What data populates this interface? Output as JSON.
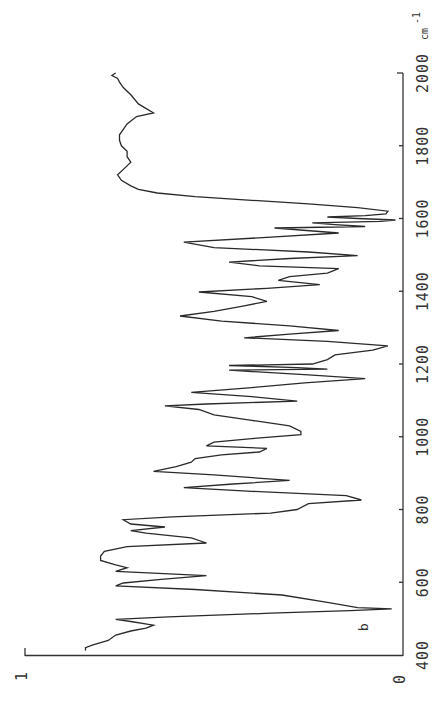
{
  "chart_data": {
    "type": "line",
    "title": "",
    "orientation": "rotated 90° (wavenumber axis vertical on right, increasing upward; transmittance axis horizontal along bottom, decreasing to the right)",
    "xlabel": "cm-1",
    "ylabel": "",
    "xlim": [
      400,
      2000
    ],
    "ylim": [
      0,
      1
    ],
    "x_ticks": [
      400,
      600,
      800,
      1000,
      1200,
      1400,
      1600,
      1800,
      2000
    ],
    "x_tick_labels": [
      "400",
      "600",
      "800",
      "1000",
      "1200",
      "1400",
      "1600",
      "1800",
      "2000"
    ],
    "x_unit": "cm",
    "x_unit_exp": "-1",
    "y_ticks": [
      0,
      1
    ],
    "y_tick_labels": [
      "0",
      "1"
    ],
    "panel_label": "b",
    "grid": false,
    "legend": null,
    "series": [
      {
        "name": "spectrum b",
        "points": [
          [
            2000,
            0.76
          ],
          [
            1993,
            0.77
          ],
          [
            1985,
            0.755
          ],
          [
            1975,
            0.75
          ],
          [
            1960,
            0.74
          ],
          [
            1940,
            0.72
          ],
          [
            1915,
            0.7
          ],
          [
            1890,
            0.66
          ],
          [
            1880,
            0.705
          ],
          [
            1860,
            0.73
          ],
          [
            1845,
            0.74
          ],
          [
            1830,
            0.75
          ],
          [
            1815,
            0.75
          ],
          [
            1800,
            0.745
          ],
          [
            1785,
            0.73
          ],
          [
            1770,
            0.73
          ],
          [
            1755,
            0.72
          ],
          [
            1740,
            0.735
          ],
          [
            1720,
            0.755
          ],
          [
            1705,
            0.745
          ],
          [
            1690,
            0.72
          ],
          [
            1680,
            0.7
          ],
          [
            1670,
            0.65
          ],
          [
            1660,
            0.55
          ],
          [
            1650,
            0.4
          ],
          [
            1640,
            0.25
          ],
          [
            1630,
            0.12
          ],
          [
            1620,
            0.04
          ],
          [
            1613,
            0.045
          ],
          [
            1608,
            0.1
          ],
          [
            1604,
            0.2
          ],
          [
            1600,
            0.12
          ],
          [
            1596,
            0.02
          ],
          [
            1592,
            0.06
          ],
          [
            1588,
            0.24
          ],
          [
            1583,
            0.18
          ],
          [
            1578,
            0.1
          ],
          [
            1574,
            0.34
          ],
          [
            1560,
            0.17
          ],
          [
            1548,
            0.36
          ],
          [
            1535,
            0.58
          ],
          [
            1520,
            0.5
          ],
          [
            1508,
            0.25
          ],
          [
            1498,
            0.12
          ],
          [
            1490,
            0.3
          ],
          [
            1480,
            0.46
          ],
          [
            1470,
            0.38
          ],
          [
            1462,
            0.17
          ],
          [
            1450,
            0.2
          ],
          [
            1440,
            0.3
          ],
          [
            1430,
            0.33
          ],
          [
            1418,
            0.22
          ],
          [
            1408,
            0.36
          ],
          [
            1398,
            0.54
          ],
          [
            1385,
            0.4
          ],
          [
            1372,
            0.36
          ],
          [
            1360,
            0.42
          ],
          [
            1345,
            0.5
          ],
          [
            1332,
            0.59
          ],
          [
            1318,
            0.48
          ],
          [
            1305,
            0.3
          ],
          [
            1292,
            0.17
          ],
          [
            1282,
            0.3
          ],
          [
            1272,
            0.42
          ],
          [
            1262,
            0.2
          ],
          [
            1250,
            0.04
          ],
          [
            1238,
            0.08
          ],
          [
            1225,
            0.18
          ],
          [
            1212,
            0.2
          ],
          [
            1200,
            0.24
          ],
          [
            1196,
            0.46
          ],
          [
            1190,
            0.28
          ],
          [
            1186,
            0.2
          ],
          [
            1183,
            0.46
          ],
          [
            1170,
            0.25
          ],
          [
            1160,
            0.1
          ],
          [
            1148,
            0.26
          ],
          [
            1135,
            0.4
          ],
          [
            1122,
            0.56
          ],
          [
            1110,
            0.4
          ],
          [
            1098,
            0.28
          ],
          [
            1090,
            0.52
          ],
          [
            1085,
            0.63
          ],
          [
            1075,
            0.54
          ],
          [
            1060,
            0.5
          ],
          [
            1045,
            0.4
          ],
          [
            1030,
            0.3
          ],
          [
            1015,
            0.27
          ],
          [
            1006,
            0.27
          ],
          [
            995,
            0.4
          ],
          [
            985,
            0.5
          ],
          [
            975,
            0.52
          ],
          [
            968,
            0.36
          ],
          [
            958,
            0.38
          ],
          [
            950,
            0.48
          ],
          [
            940,
            0.55
          ],
          [
            930,
            0.56
          ],
          [
            918,
            0.6
          ],
          [
            905,
            0.66
          ],
          [
            895,
            0.5
          ],
          [
            880,
            0.3
          ],
          [
            870,
            0.45
          ],
          [
            860,
            0.58
          ],
          [
            850,
            0.4
          ],
          [
            838,
            0.15
          ],
          [
            826,
            0.11
          ],
          [
            816,
            0.25
          ],
          [
            800,
            0.28
          ],
          [
            790,
            0.35
          ],
          [
            780,
            0.61
          ],
          [
            772,
            0.74
          ],
          [
            760,
            0.72
          ],
          [
            752,
            0.63
          ],
          [
            742,
            0.72
          ],
          [
            735,
            0.68
          ],
          [
            722,
            0.56
          ],
          [
            708,
            0.52
          ],
          [
            698,
            0.73
          ],
          [
            685,
            0.79
          ],
          [
            672,
            0.8
          ],
          [
            660,
            0.8
          ],
          [
            648,
            0.76
          ],
          [
            640,
            0.73
          ],
          [
            630,
            0.76
          ],
          [
            618,
            0.52
          ],
          [
            608,
            0.64
          ],
          [
            598,
            0.74
          ],
          [
            590,
            0.76
          ],
          [
            580,
            0.55
          ],
          [
            565,
            0.32
          ],
          [
            545,
            0.2
          ],
          [
            530,
            0.12
          ],
          [
            527,
            0.03
          ],
          [
            522,
            0.14
          ],
          [
            515,
            0.35
          ],
          [
            505,
            0.62
          ],
          [
            498,
            0.76
          ],
          [
            492,
            0.72
          ],
          [
            482,
            0.66
          ],
          [
            474,
            0.68
          ],
          [
            466,
            0.72
          ],
          [
            455,
            0.76
          ],
          [
            440,
            0.78
          ],
          [
            428,
            0.82
          ],
          [
            420,
            0.84
          ],
          [
            412,
            0.84
          ]
        ]
      }
    ]
  },
  "axes": {
    "x_axis": {
      "tick_labels": [
        "400",
        "600",
        "800",
        "1000",
        "1200",
        "1400",
        "1600",
        "1800",
        "2000"
      ],
      "unit_base": "cm",
      "unit_exp": "-1"
    },
    "y_axis": {
      "label_zero": "0",
      "label_one": "1"
    }
  },
  "annotations": {
    "panel_label": "b"
  }
}
